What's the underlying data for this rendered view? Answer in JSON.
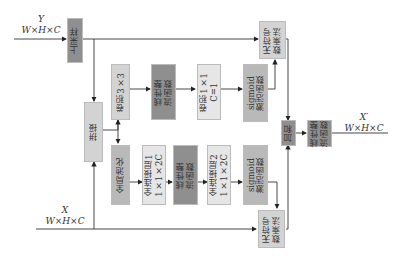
{
  "inputs": {
    "y": {
      "name": "Y",
      "shape": "W×H×C"
    },
    "x": {
      "name": "X",
      "shape": "W×H×C"
    }
  },
  "output": {
    "name": "X′",
    "shape": "W×H×C"
  },
  "blocks": {
    "upsample": "上采样",
    "concat": "拼接",
    "conv3": "卷积3×3",
    "relu_top": "线性整\n流函数",
    "conv1": "卷积1×1\nC=1",
    "sigmoid_top": "sigmoid\n激活函数",
    "mul_top": "无符号\n数乘法",
    "gap": "全局池化",
    "fc1": "全连接层1\n1×1×2C",
    "relu_mid": "线性整\n流函数",
    "fc2": "全连接层2\n1×1×2C",
    "sigmoid_bot": "sigmoid\n激活函数",
    "mul_bot": "无符号\n数乘法",
    "add": "加和",
    "relu_out": "线性整\n流函数"
  }
}
